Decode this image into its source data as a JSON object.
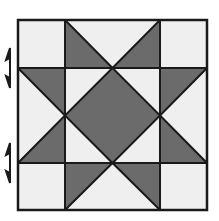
{
  "diagram": {
    "colors": {
      "dark": "#6b6b6b",
      "light": "#efefef",
      "line": "#1a1a1a",
      "background": "#ffffff"
    },
    "grid": {
      "x_lines": [
        18,
        65,
        160,
        207
      ],
      "y_lines": [
        20,
        68,
        163,
        210
      ]
    },
    "markers": [
      {
        "name": "half-arrow-upper",
        "x": 9,
        "y_top": 48,
        "y_bottom": 88
      },
      {
        "name": "half-arrow-lower",
        "x": 9,
        "y_top": 143,
        "y_bottom": 183
      }
    ]
  }
}
